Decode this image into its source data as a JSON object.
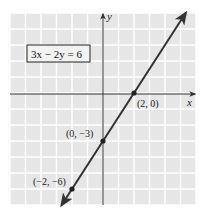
{
  "chart_data": {
    "type": "line",
    "title": "",
    "equation": "3x − 2y = 6",
    "xlabel": "x",
    "ylabel": "y",
    "xlim": [
      -6,
      6
    ],
    "ylim": [
      -7,
      5
    ],
    "grid": true,
    "series": [
      {
        "name": "3x − 2y = 6",
        "slope": 1.5,
        "intercept": -3,
        "x": [
          -2.667,
          5.333
        ],
        "y": [
          -7,
          5
        ],
        "arrows": "both"
      }
    ],
    "points": [
      {
        "x": 2,
        "y": 0,
        "label": "(2, 0)"
      },
      {
        "x": 0,
        "y": -3,
        "label": "(0, −3)"
      },
      {
        "x": -2,
        "y": -6,
        "label": "(−2, −6)"
      }
    ],
    "legend": "none"
  },
  "labels": {
    "equation": "3x − 2y = 6",
    "x_axis": "x",
    "y_axis": "y",
    "point_1": "(2, 0)",
    "point_2": "(0, −3)",
    "point_3": "(−2, −6)"
  },
  "colors": {
    "grid_bg": "#e6e6e6",
    "grid_line": "#ffffff",
    "axis": "#333333",
    "line": "#333333"
  }
}
